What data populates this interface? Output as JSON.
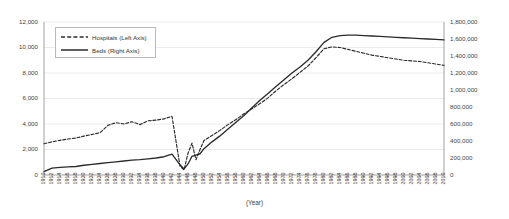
{
  "chart_data": {
    "type": "line",
    "title": "",
    "xlabel": "(Year)",
    "ylabel": "",
    "grid": true,
    "legend_position": "upper-left-inside",
    "axes": {
      "left": {
        "name": "Hospitals",
        "ylim": [
          0,
          12000
        ],
        "ticks": [
          0,
          2000,
          4000,
          6000,
          8000,
          10000,
          12000
        ],
        "tick_labels": [
          "0",
          "2,000",
          "4,000",
          "6,000",
          "8,000",
          "10,000",
          "12,000"
        ]
      },
      "right": {
        "name": "Beds",
        "ylim": [
          0,
          1800000
        ],
        "ticks": [
          0,
          200000,
          400000,
          600000,
          800000,
          1000000,
          1200000,
          1400000,
          1600000,
          1800000
        ],
        "tick_labels": [
          "0",
          "200,000",
          "400,000",
          "600,000",
          "800,000",
          "1,000,000",
          "1,200,000",
          "1,400,000",
          "1,600,000",
          "1,800,000"
        ]
      }
    },
    "xlim": [
      1910,
      2010
    ],
    "tick_labels": [
      "1910",
      "1912",
      "1914",
      "1916",
      "1918",
      "1920",
      "1922",
      "1924",
      "1926",
      "1928",
      "1930",
      "1932",
      "1934",
      "1936",
      "1938",
      "1940",
      "1942",
      "1944",
      "1946",
      "1948",
      "1950",
      "1952",
      "1954",
      "1956",
      "1958",
      "1960",
      "1962",
      "1964",
      "1966",
      "1968",
      "1970",
      "1972",
      "1974",
      "1976",
      "1978",
      "1980",
      "1982",
      "1984",
      "1986",
      "1988",
      "1990",
      "1992",
      "1994",
      "1996",
      "1998",
      "2000",
      "2002",
      "2004",
      "2006",
      "2008",
      "2010"
    ],
    "x": [
      1910,
      1912,
      1914,
      1916,
      1918,
      1920,
      1922,
      1924,
      1926,
      1928,
      1930,
      1932,
      1934,
      1936,
      1938,
      1940,
      1942,
      1944,
      1945,
      1946,
      1947,
      1948,
      1949,
      1950,
      1952,
      1954,
      1956,
      1958,
      1960,
      1962,
      1964,
      1966,
      1968,
      1970,
      1972,
      1974,
      1976,
      1978,
      1980,
      1982,
      1984,
      1986,
      1988,
      1990,
      1992,
      1994,
      1996,
      1998,
      2000,
      2002,
      2004,
      2006,
      2008,
      2010
    ],
    "series": [
      {
        "name": "Hospitals (Left Axis)",
        "axis": "left",
        "style": "dashed",
        "color": "#2b2b2b",
        "values": [
          2450,
          2600,
          2720,
          2820,
          2900,
          3050,
          3180,
          3320,
          3900,
          4100,
          4000,
          4180,
          3950,
          4250,
          4300,
          4400,
          4600,
          700,
          400,
          1700,
          2500,
          1200,
          2000,
          2700,
          3100,
          3500,
          3950,
          4350,
          4800,
          5200,
          5600,
          6050,
          6600,
          7100,
          7550,
          8050,
          8550,
          9200,
          9900,
          10050,
          10000,
          9850,
          9700,
          9550,
          9400,
          9300,
          9200,
          9100,
          9000,
          8950,
          8900,
          8800,
          8700,
          8600
        ]
      },
      {
        "name": "Beds (Right Axis)",
        "axis": "right",
        "style": "solid",
        "color": "#2b2b2b",
        "values": [
          40000,
          80000,
          90000,
          95000,
          100000,
          115000,
          125000,
          135000,
          145000,
          155000,
          165000,
          175000,
          180000,
          190000,
          200000,
          215000,
          245000,
          120000,
          70000,
          130000,
          220000,
          235000,
          250000,
          310000,
          390000,
          460000,
          540000,
          620000,
          700000,
          790000,
          880000,
          960000,
          1040000,
          1120000,
          1200000,
          1270000,
          1350000,
          1450000,
          1560000,
          1620000,
          1640000,
          1645000,
          1645000,
          1640000,
          1635000,
          1630000,
          1625000,
          1620000,
          1615000,
          1610000,
          1605000,
          1600000,
          1595000,
          1590000
        ]
      }
    ]
  }
}
